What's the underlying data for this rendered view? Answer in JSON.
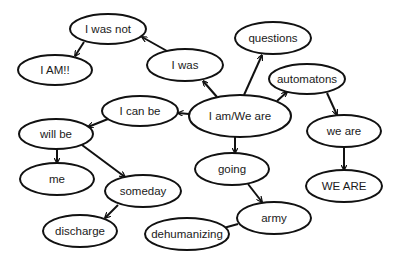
{
  "diagram": {
    "type": "concept-map",
    "colors": {
      "stroke": "#111111",
      "fill": "#ffffff",
      "text": "#1a1a1a"
    },
    "nodes": [
      {
        "id": "i_was_not",
        "label": "I was not",
        "cx": 108,
        "cy": 29,
        "rx": 38,
        "ry": 15
      },
      {
        "id": "i_am_excl",
        "label": "I AM!!",
        "cx": 55,
        "cy": 70,
        "rx": 37,
        "ry": 15
      },
      {
        "id": "i_was",
        "label": "I was",
        "cx": 185,
        "cy": 65,
        "rx": 38,
        "ry": 16
      },
      {
        "id": "questions",
        "label": "questions",
        "cx": 273,
        "cy": 38,
        "rx": 38,
        "ry": 16
      },
      {
        "id": "automatons",
        "label": "automatons",
        "cx": 307,
        "cy": 79,
        "rx": 38,
        "ry": 15
      },
      {
        "id": "i_am_we_are",
        "label": "I am/We are",
        "cx": 240,
        "cy": 116,
        "rx": 51,
        "ry": 21
      },
      {
        "id": "i_can_be",
        "label": "I can be",
        "cx": 140,
        "cy": 111,
        "rx": 38,
        "ry": 15
      },
      {
        "id": "will_be",
        "label": "will be",
        "cx": 56,
        "cy": 134,
        "rx": 37,
        "ry": 15
      },
      {
        "id": "me",
        "label": "me",
        "cx": 57,
        "cy": 179,
        "rx": 37,
        "ry": 16
      },
      {
        "id": "someday",
        "label": "someday",
        "cx": 143,
        "cy": 191,
        "rx": 38,
        "ry": 16
      },
      {
        "id": "discharge",
        "label": "discharge",
        "cx": 80,
        "cy": 231,
        "rx": 37,
        "ry": 16
      },
      {
        "id": "going",
        "label": "going",
        "cx": 232,
        "cy": 169,
        "rx": 37,
        "ry": 16
      },
      {
        "id": "we_are",
        "label": "we are",
        "cx": 344,
        "cy": 131,
        "rx": 37,
        "ry": 16
      },
      {
        "id": "WE_ARE",
        "label": "WE ARE",
        "cx": 344,
        "cy": 186,
        "rx": 38,
        "ry": 16
      },
      {
        "id": "army",
        "label": "army",
        "cx": 274,
        "cy": 218,
        "rx": 37,
        "ry": 16
      },
      {
        "id": "dehumanizing",
        "label": "dehumanizing",
        "cx": 187,
        "cy": 234,
        "rx": 42,
        "ry": 16
      }
    ],
    "edges": [
      {
        "from": "i_am_we_are",
        "to": "i_was",
        "x1": 217,
        "y1": 97,
        "x2": 203,
        "y2": 81
      },
      {
        "from": "i_was",
        "to": "i_was_not",
        "x1": 167,
        "y1": 51,
        "x2": 142,
        "y2": 37
      },
      {
        "from": "i_was_not",
        "to": "i_am_excl",
        "x1": 84,
        "y1": 42,
        "x2": 75,
        "y2": 56
      },
      {
        "from": "i_am_we_are",
        "to": "questions",
        "x1": 244,
        "y1": 95,
        "x2": 262,
        "y2": 55
      },
      {
        "from": "i_am_we_are",
        "to": "automatons",
        "x1": 277,
        "y1": 101,
        "x2": 287,
        "y2": 92
      },
      {
        "from": "automatons",
        "to": "we_are",
        "x1": 327,
        "y1": 93,
        "x2": 337,
        "y2": 115
      },
      {
        "from": "we_are",
        "to": "WE_ARE",
        "x1": 344,
        "y1": 147,
        "x2": 344,
        "y2": 170
      },
      {
        "from": "i_am_we_are",
        "to": "i_can_be",
        "x1": 189,
        "y1": 114,
        "x2": 178,
        "y2": 113
      },
      {
        "from": "i_can_be",
        "to": "will_be",
        "x1": 108,
        "y1": 119,
        "x2": 88,
        "y2": 127
      },
      {
        "from": "will_be",
        "to": "me",
        "x1": 57,
        "y1": 149,
        "x2": 57,
        "y2": 163
      },
      {
        "from": "will_be",
        "to": "someday",
        "x1": 82,
        "y1": 145,
        "x2": 125,
        "y2": 177
      },
      {
        "from": "someday",
        "to": "discharge",
        "x1": 118,
        "y1": 205,
        "x2": 105,
        "y2": 218
      },
      {
        "from": "i_am_we_are",
        "to": "going",
        "x1": 235,
        "y1": 137,
        "x2": 235,
        "y2": 153
      },
      {
        "from": "going",
        "to": "army",
        "x1": 248,
        "y1": 184,
        "x2": 262,
        "y2": 202
      },
      {
        "from": "army",
        "to": "dehumanizing",
        "x1": 238,
        "y1": 224,
        "x2": 220,
        "y2": 229
      }
    ]
  }
}
